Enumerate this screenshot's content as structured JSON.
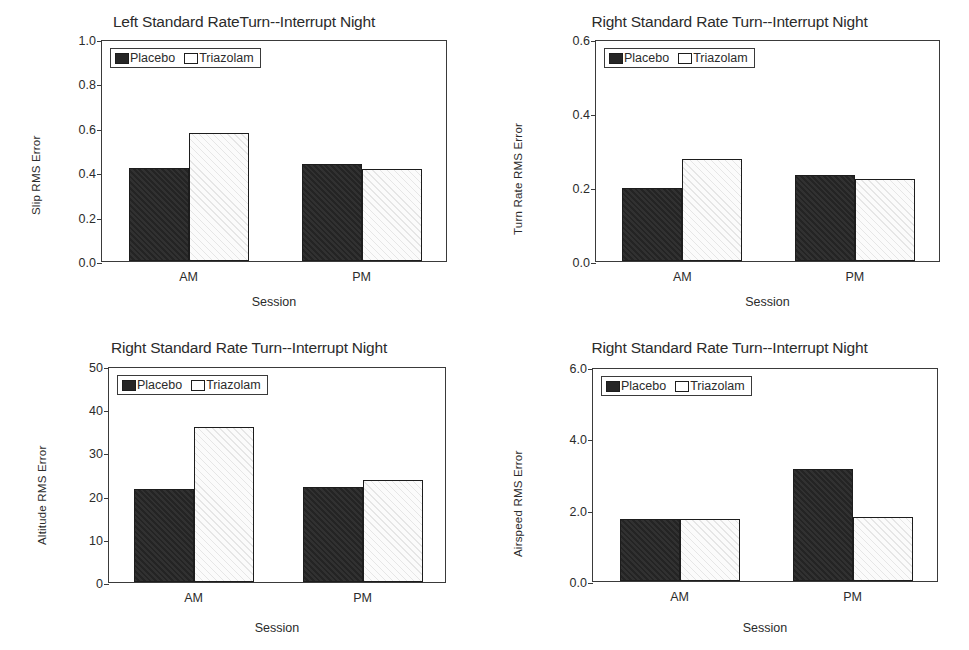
{
  "figure": {
    "legend_labels": [
      "Placebo",
      "Triazolam"
    ],
    "series_colors": {
      "placebo": "#262626",
      "triazolam": "#ffffff"
    },
    "axis_color": "#3a3a3a",
    "background": "#ffffff"
  },
  "chart_data": [
    {
      "id": "slip",
      "type": "bar",
      "title": "Left Standard RateTurn--Interrupt Night",
      "xlabel": "Session",
      "ylabel": "Slip RMS Error",
      "categories": [
        "AM",
        "PM"
      ],
      "yticks": [
        "0.0",
        "0.2",
        "0.4",
        "0.6",
        "0.8",
        "1.0"
      ],
      "ytickvals": [
        0.0,
        0.2,
        0.4,
        0.6,
        0.8,
        1.0
      ],
      "ylim": [
        0.0,
        1.0
      ],
      "grid": false,
      "legend_position": "upper-left-inside",
      "series": [
        {
          "name": "Placebo",
          "values": [
            0.42,
            0.435
          ]
        },
        {
          "name": "Triazolam",
          "values": [
            0.575,
            0.415
          ]
        }
      ]
    },
    {
      "id": "turn-rate",
      "type": "bar",
      "title": "Right Standard Rate Turn--Interrupt Night",
      "xlabel": "Session",
      "ylabel": "Turn Rate RMS Error",
      "categories": [
        "AM",
        "PM"
      ],
      "yticks": [
        "0.0",
        "0.2",
        "0.4",
        "0.6"
      ],
      "ytickvals": [
        0.0,
        0.2,
        0.4,
        0.6
      ],
      "ylim": [
        0.0,
        0.6
      ],
      "grid": false,
      "legend_position": "upper-left-inside",
      "series": [
        {
          "name": "Placebo",
          "values": [
            0.198,
            0.233
          ]
        },
        {
          "name": "Triazolam",
          "values": [
            0.276,
            0.222
          ]
        }
      ]
    },
    {
      "id": "altitude",
      "type": "bar",
      "title": "Right Standard Rate Turn--Interrupt Night",
      "xlabel": "Session",
      "ylabel": "Altitude RMS Error",
      "categories": [
        "AM",
        "PM"
      ],
      "yticks": [
        "0",
        "10",
        "20",
        "30",
        "40",
        "50"
      ],
      "ytickvals": [
        0,
        10,
        20,
        30,
        40,
        50
      ],
      "ylim": [
        0,
        50
      ],
      "grid": false,
      "legend_position": "upper-left-inside",
      "series": [
        {
          "name": "Placebo",
          "values": [
            21.5,
            22.0
          ]
        },
        {
          "name": "Triazolam",
          "values": [
            35.8,
            23.6
          ]
        }
      ]
    },
    {
      "id": "airspeed",
      "type": "bar",
      "title": "Right Standard Rate Turn--Interrupt Night",
      "xlabel": "Session",
      "ylabel": "Airspeed RMS Error",
      "categories": [
        "AM",
        "PM"
      ],
      "yticks": [
        "0.0",
        "2.0",
        "4.0",
        "6.0"
      ],
      "ytickvals": [
        0.0,
        2.0,
        4.0,
        6.0
      ],
      "ylim": [
        0.0,
        6.0
      ],
      "grid": false,
      "legend_position": "upper-left-inside",
      "series": [
        {
          "name": "Placebo",
          "values": [
            1.75,
            3.15
          ]
        },
        {
          "name": "Triazolam",
          "values": [
            1.73,
            1.8
          ]
        }
      ]
    }
  ]
}
